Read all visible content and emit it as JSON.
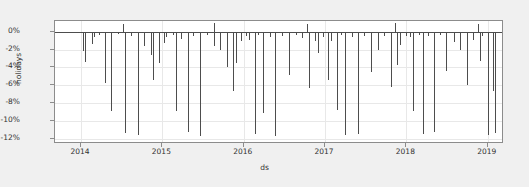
{
  "chart_data": {
    "type": "bar",
    "title": "",
    "xlabel": "ds",
    "ylabel": "holidays",
    "grid": true,
    "legend": null,
    "ylim": [
      -12.6,
      1.2
    ],
    "ytick_labels": [
      "0%",
      "-2%",
      "-4%",
      "-6%",
      "-8%",
      "-10%",
      "-12%"
    ],
    "ytick_values": [
      0,
      -2,
      -4,
      -6,
      -8,
      -10,
      -12
    ],
    "xtick_labels": [
      "2014",
      "2015",
      "2016",
      "2017",
      "2018",
      "2019"
    ],
    "xtick_values": [
      2014.0,
      2015.0,
      2016.0,
      2017.0,
      2018.0,
      2019.0
    ],
    "xlim": [
      2013.68,
      2019.2
    ],
    "series_name": "holidays",
    "series_color": "#4d4d4d",
    "x": [
      2014.02,
      2014.05,
      2014.13,
      2014.16,
      2014.22,
      2014.3,
      2014.37,
      2014.46,
      2014.54,
      2014.62,
      2014.7,
      2014.78,
      2014.86,
      2014.89,
      2014.96,
      2015.02,
      2015.05,
      2015.13,
      2015.17,
      2015.23,
      2015.31,
      2015.38,
      2015.46,
      2015.55,
      2015.63,
      2015.71,
      2015.79,
      2015.87,
      2015.9,
      2015.97,
      2016.03,
      2016.06,
      2016.14,
      2016.18,
      2016.24,
      2016.32,
      2016.39,
      2016.47,
      2016.56,
      2016.64,
      2016.72,
      2016.8,
      2016.88,
      2016.91,
      2016.98,
      2017.04,
      2017.07,
      2017.15,
      2017.19,
      2017.25,
      2017.33,
      2017.4,
      2017.48,
      2017.57,
      2017.65,
      2017.73,
      2017.81,
      2017.89,
      2017.92,
      2017.99,
      2018.05,
      2018.08,
      2018.16,
      2018.2,
      2018.26,
      2018.34,
      2018.41,
      2018.49,
      2018.58,
      2018.66,
      2018.74,
      2018.82,
      2018.9,
      2018.93,
      2019.0,
      2019.06,
      2019.09
    ],
    "values": [
      -2.2,
      -3.4,
      -1.4,
      -0.6,
      -0.4,
      -5.8,
      -8.9,
      -0.3,
      -11.4,
      -0.5,
      -11.6,
      -1.6,
      -2.6,
      -5.4,
      -3.5,
      -1.3,
      -0.6,
      -0.4,
      -8.9,
      -0.8,
      -11.3,
      -0.5,
      -11.7,
      -0.4,
      -1.6,
      -2.1,
      -4.0,
      -6.7,
      -3.5,
      -1.1,
      -0.5,
      -0.9,
      -11.5,
      -0.4,
      -9.1,
      -0.6,
      -11.7,
      -0.5,
      -4.9,
      -0.4,
      -0.7,
      -6.3,
      -1.0,
      -2.4,
      -0.6,
      -5.4,
      -1.0,
      -8.8,
      -0.4,
      -11.6,
      -0.6,
      -11.5,
      -0.5,
      -4.5,
      -2.0,
      -0.5,
      -6.2,
      -3.7,
      -1.5,
      -0.5,
      -0.6,
      -8.9,
      -0.4,
      -11.5,
      -0.5,
      -11.3,
      -0.4,
      -4.4,
      -1.2,
      -2.1,
      -6.0,
      -0.9,
      -3.3,
      -0.5,
      -11.6,
      -6.6,
      -11.4
    ],
    "positive_spikes": {
      "x": [
        2014.52,
        2015.64,
        2016.78,
        2017.86,
        2018.88
      ],
      "values": [
        0.9,
        0.95,
        0.9,
        0.95,
        0.85
      ]
    },
    "background_color": "#f0f0f0",
    "plot_background_color": "#ffffff",
    "grid_color": "#e8e8e8",
    "axis_color": "#8c8c8c"
  }
}
